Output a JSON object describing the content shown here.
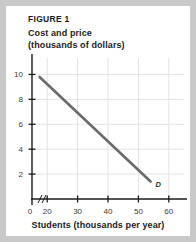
{
  "figure": {
    "label": "FIGURE 1",
    "y_axis_title_line1": "Cost and price",
    "y_axis_title_line2": "(thousands of dollars)",
    "x_axis_title": "Students (thousands per year)"
  },
  "colors": {
    "page_background": "#c9c9c9",
    "panel_background": "#ffffff",
    "axis": "#1b1b1b",
    "gridline": "#e3e3e3",
    "curve": "#6b6b6b",
    "text": "#1b1b1b"
  },
  "chart_data": {
    "type": "line",
    "title": "FIGURE 1",
    "xlabel": "Students (thousands per year)",
    "ylabel": "Cost and price (thousands of dollars)",
    "xlim": [
      15,
      65
    ],
    "ylim": [
      0,
      11
    ],
    "x_origin_label": "0",
    "x_axis_break": true,
    "grid": true,
    "legend": "none",
    "xticks": [
      20,
      30,
      40,
      50,
      60
    ],
    "xtick_labels": [
      "20",
      "30",
      "40",
      "50",
      "60"
    ],
    "yticks": [
      2,
      4,
      6,
      8,
      10
    ],
    "ytick_labels": [
      "2",
      "4",
      "6",
      "8",
      "10"
    ],
    "series": [
      {
        "name": "D",
        "annotation": "D",
        "annotation_x": 56.5,
        "annotation_y": 1.2,
        "x": [
          17.5,
          54
        ],
        "values": [
          9.8,
          1.4
        ]
      }
    ]
  }
}
